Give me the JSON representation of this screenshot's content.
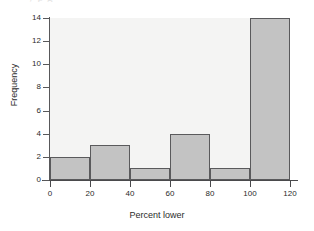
{
  "caption_fragment": "y      p        g",
  "chart_data": {
    "type": "bar",
    "title": "",
    "subtitle": "",
    "xlabel": "Percent lower",
    "ylabel": "Frequency",
    "categories": [
      "0-20",
      "20-40",
      "40-60",
      "60-80",
      "80-100",
      "100-120"
    ],
    "bin_edges": [
      0,
      20,
      40,
      60,
      80,
      100,
      120
    ],
    "values": [
      2,
      3,
      1,
      4,
      1,
      14
    ],
    "xlim": [
      0,
      120
    ],
    "ylim": [
      0,
      14
    ],
    "xticks": [
      0,
      20,
      40,
      60,
      80,
      100,
      120
    ],
    "yticks": [
      0,
      2,
      4,
      6,
      8,
      10,
      12,
      14
    ],
    "xtick_labels": [
      "0",
      "20",
      "40",
      "60",
      "80",
      "100",
      "120"
    ],
    "ytick_labels": [
      "0",
      "2",
      "4",
      "6",
      "8",
      "10",
      "12",
      "14"
    ],
    "grid": false,
    "legend": false,
    "legend_position": "none",
    "bar_fill_color": "#c3c3c3",
    "bar_edge_color": "#5a5a5c",
    "plot_background_color": "#f4f4f3",
    "axis_color": "#4a4a4c",
    "text_color": "#2b2b2b"
  }
}
